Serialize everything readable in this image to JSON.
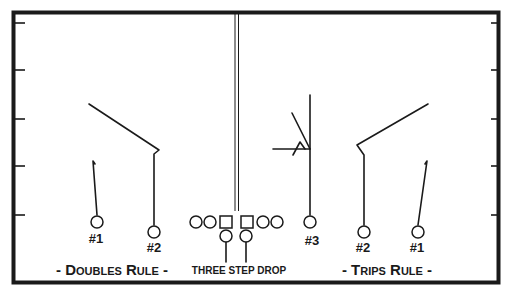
{
  "diagram": {
    "type": "football-play-diagram",
    "title": "Three Step Drop",
    "colors": {
      "ink": "#1a1a1a",
      "background": "#ffffff"
    },
    "left_side": {
      "caption_prefix": "- D",
      "caption_small": "OUBLES",
      "caption_mid": " R",
      "caption_small2": "ULE",
      "caption_suffix": " -",
      "caption": "- Doubles Rule -",
      "receivers": [
        {
          "label": "#1",
          "shape": "circle",
          "route": "fade"
        },
        {
          "label": "#2",
          "shape": "circle",
          "route": "corner"
        }
      ]
    },
    "center": {
      "caption": "THREE STEP DROP",
      "offensive_line": [
        "circle",
        "circle",
        "square",
        "square",
        "circle",
        "circle"
      ],
      "backs": [
        "circle",
        "circle"
      ]
    },
    "right_side": {
      "caption_prefix": "- T",
      "caption_small": "RIPS",
      "caption_mid": " R",
      "caption_small2": "ULE",
      "caption_suffix": " -",
      "caption": "- Trips Rule -",
      "receivers": [
        {
          "label": "#3",
          "shape": "circle",
          "route": "vertical with reads"
        },
        {
          "label": "#2",
          "shape": "circle",
          "route": "corner"
        },
        {
          "label": "#1",
          "shape": "circle",
          "route": "fade"
        }
      ]
    }
  }
}
